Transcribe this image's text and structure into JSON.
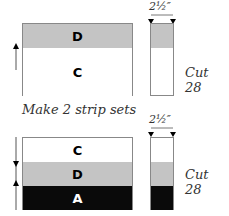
{
  "colors": {
    "gray": "#c4c4c4",
    "black": "#0a0a0a",
    "white": "#ffffff",
    "line": "#888888"
  },
  "top_set": {
    "bands": [
      {
        "label": "D",
        "fill": "gray"
      },
      {
        "label": "C",
        "fill": "white"
      }
    ],
    "dimension": "2½″",
    "cut_label": "Cut 28",
    "pressing_arrow": "up"
  },
  "caption": "Make 2 strip sets",
  "bottom_set": {
    "bands": [
      {
        "label": "C",
        "fill": "white"
      },
      {
        "label": "D",
        "fill": "gray"
      },
      {
        "label": "A",
        "fill": "black"
      }
    ],
    "dimension": "2½″",
    "cut_label": "Cut 28",
    "pressing_arrows": [
      "down",
      "up"
    ]
  }
}
